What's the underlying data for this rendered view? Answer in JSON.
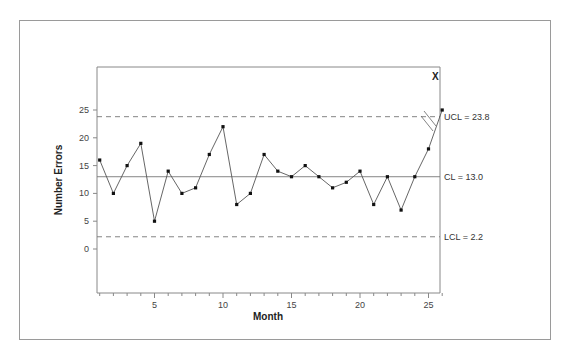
{
  "chart_data": {
    "type": "line",
    "title": "",
    "xlabel": "Month",
    "ylabel": "Number Errors",
    "x": [
      1,
      2,
      3,
      4,
      5,
      6,
      7,
      8,
      9,
      10,
      11,
      12,
      13,
      14,
      15,
      16,
      17,
      18,
      19,
      20,
      21,
      22,
      23,
      24,
      25,
      26
    ],
    "series": [
      {
        "name": "Number Errors",
        "values": [
          16,
          10,
          15,
          19,
          5,
          14,
          10,
          11,
          17,
          22,
          8,
          10,
          17,
          14,
          13,
          15,
          13,
          11,
          12,
          14,
          8,
          13,
          7,
          13,
          18,
          25
        ]
      }
    ],
    "xticks": [
      5,
      10,
      15,
      20,
      25
    ],
    "yticks": [
      0,
      5,
      10,
      15,
      20,
      25
    ],
    "xlim": [
      1,
      26
    ],
    "ylim": [
      -2,
      27
    ],
    "grid": false,
    "control_lines": [
      {
        "name": "UCL",
        "value": 23.8,
        "label": "UCL = 23.8",
        "style": "dashed"
      },
      {
        "name": "CL",
        "value": 13.0,
        "label": "CL = 13.0",
        "style": "solid"
      },
      {
        "name": "LCL",
        "value": 2.2,
        "label": "LCL = 2.2",
        "style": "dashed"
      }
    ],
    "annotations": [
      {
        "text": "X",
        "x": 26,
        "y": 25,
        "meaning": "out-of-control point"
      },
      {
        "text": "//",
        "x": 25.5,
        "meaning": "break marker on segment"
      }
    ]
  },
  "labels": {
    "xlabel": "Month",
    "ylabel": "Number Errors",
    "ucl": "UCL = 23.8",
    "cl": "CL = 13.0",
    "lcl": "LCL = 2.2",
    "out_marker": "X",
    "xticks": [
      "5",
      "10",
      "15",
      "20",
      "25"
    ],
    "yticks": [
      "0",
      "5",
      "10",
      "15",
      "20",
      "25"
    ]
  }
}
